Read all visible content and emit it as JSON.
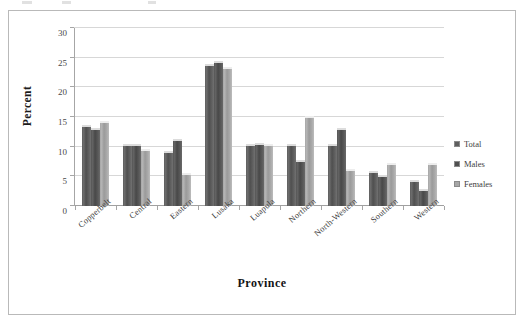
{
  "figure": {
    "frame_border_color": "#b9b9b9",
    "background": "#ffffff"
  },
  "chart_data": {
    "type": "bar",
    "title": "",
    "xlabel": "Province",
    "ylabel": "Percent",
    "ylim": [
      0,
      30
    ],
    "yticks": [
      0,
      5,
      10,
      15,
      20,
      25,
      30
    ],
    "ytick_labels": [
      "0",
      "5",
      "10",
      "15",
      "20",
      "25",
      "30"
    ],
    "grid": true,
    "grid_axis": "y",
    "legend_position": "right",
    "categories": [
      "Copperbelt",
      "Central",
      "Eastern",
      "Lusaka",
      "Luapula",
      "Northern",
      "North-Western",
      "Southern",
      "Western"
    ],
    "series": [
      {
        "name": "Total",
        "color": "#5e5e5e",
        "values": [
          13.6,
          10.5,
          9.2,
          23.9,
          10.5,
          10.5,
          10.5,
          5.9,
          4.4
        ]
      },
      {
        "name": "Males",
        "color": "#4f4f4f",
        "values": [
          13.2,
          10.4,
          11.3,
          24.5,
          10.7,
          7.8,
          13.2,
          5.2,
          2.9
        ]
      },
      {
        "name": "Females",
        "color": "#a6a6a6",
        "values": [
          14.4,
          9.6,
          5.5,
          23.4,
          10.4,
          15.2,
          6.2,
          7.2,
          7.2
        ]
      }
    ]
  },
  "legend": {
    "items": [
      {
        "label": "Total",
        "color": "#5e5e5e"
      },
      {
        "label": "Males",
        "color": "#4f4f4f"
      },
      {
        "label": "Females",
        "color": "#a6a6a6"
      }
    ]
  }
}
